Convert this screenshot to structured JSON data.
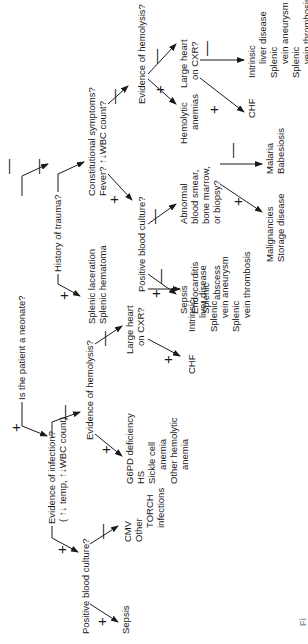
{
  "diagram": {
    "root": "Is the patient a neonate?",
    "neonate_yes": {
      "question": "Evidence of infection?",
      "question_sub": "( ↑↓ temp, ↑↓WBC count)",
      "infection_yes": {
        "question": "Positive blood culture?",
        "yes": [
          "Sepsis"
        ],
        "no": [
          "CMV",
          "Other",
          "TORCH",
          "infections"
        ]
      },
      "infection_no": {
        "question": "Evidence of hemolysis?",
        "yes": [
          "G6PD deficiency",
          "HS",
          "Sickle cell",
          "anemia",
          "Other hemolytic",
          "anemia"
        ],
        "no": {
          "question": [
            "Large heart",
            "on CXR?"
          ],
          "yes": [
            "CHF"
          ],
          "no": [
            "Intrinsic",
            "liver disease",
            "Splenic",
            "vein aneurysm",
            "Splenic",
            "vein thrombosis"
          ]
        }
      }
    },
    "neonate_no": {
      "question": "History of trauma?",
      "trauma_yes": [
        "Splenic laceration",
        "Splenic hematoma"
      ],
      "trauma_no": {
        "question": [
          "Constitutional symptoms?",
          "Fever? ↑↓WBC count?"
        ],
        "yes": {
          "question": "Positive blood culture?",
          "yes": [
            "Sepsis",
            "Endocarditis",
            "Splenic",
            "abscess"
          ],
          "no": {
            "question": [
              "Abnormal",
              "blood smear,",
              "bone marrow,",
              "or biopsy?"
            ],
            "yes": [
              "Malignancies",
              "Storage disease"
            ],
            "no": [
              "Malaria",
              "Babesiosis"
            ]
          }
        },
        "no": {
          "question": "Evidence of hemolysis?",
          "yes": [
            "Hemolytic",
            "anemias"
          ],
          "no": {
            "question": [
              "Large heart",
              "on CXR?"
            ],
            "yes": [
              "CHF"
            ],
            "no": [
              "Intrinsic",
              "liver disease",
              "Splenic",
              "vein aneurysm",
              "Splenic",
              "vein thrombosis"
            ]
          }
        }
      }
    },
    "signs": {
      "plus": "+",
      "minus": "—"
    },
    "caption_fragment": "Fi"
  }
}
